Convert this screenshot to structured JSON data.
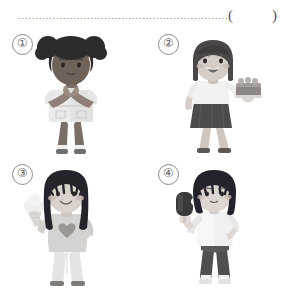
{
  "page": {
    "kind": "worksheet-question",
    "background_color": "#ffffff",
    "ink_color": "#2b2b2b"
  },
  "question": {
    "answer_line_text": "......................................................................",
    "answer_bracket": "(        )",
    "dot_color": "#8f8f8f"
  },
  "options": [
    {
      "number": "①",
      "figure_name": "girl-with-afro-puffs-holding-ice-cream",
      "description": "Girl with two afro puff buns, dark skin, holding an ice cream cone with both hands at chest level, wearing a light short-sleeve dress",
      "colors": {
        "hair": "#2e2b2c",
        "skin": "#8d7f77",
        "clothes": "#e2e2e0",
        "clothes_shade": "#cfcfcd",
        "legs": "#7a6e67",
        "shoes": "#6e6e6e",
        "food": "#efeceb"
      },
      "food_item": "ice-cream-cone"
    },
    {
      "number": "②",
      "figure_name": "girl-holding-cake-on-palm",
      "description": "Girl with shoulder-length dark hair, open smiling mouth, white top and dark gray skirt, balancing a cake on her raised right palm",
      "colors": {
        "hair": "#4a4746",
        "skin": "#d6cdc7",
        "top": "#f2f2f1",
        "skirt": "#4e4c4b",
        "legs": "#cfc6bf",
        "shoes": "#5a5755",
        "food": "#8c8785"
      },
      "food_item": "cake"
    },
    {
      "number": "③",
      "figure_name": "girl-holding-ice-cream-cone",
      "description": "Girl with long dark hair and bangs, rosy cheeks, light top with a heart on the chest, holding a tall ice cream cone in her raised hand",
      "colors": {
        "hair": "#26242a",
        "skin": "#dad2cc",
        "top": "#d5d3d1",
        "heart": "#9b9795",
        "pants": "#e6e4e2",
        "shoes": "#7e7b79",
        "food": "#efeeec"
      },
      "food_item": "ice-cream-cone"
    },
    {
      "number": "④",
      "figure_name": "girl-holding-popsicle",
      "description": "Girl with a dark bob haircut and bangs, white sleeveless top and dark gray trousers, holding a dark popsicle on a stick in her outstretched hand",
      "colors": {
        "hair": "#24222a",
        "skin": "#ded6d0",
        "top": "#f1f0ef",
        "pants": "#514f4e",
        "shoes": "#f2f1f0",
        "food": "#3a3839"
      },
      "food_item": "popsicle"
    }
  ]
}
